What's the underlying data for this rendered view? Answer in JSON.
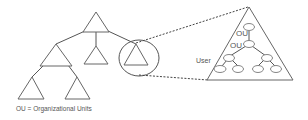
{
  "diagram": {
    "type": "hierarchy-tree",
    "legend": "OU = Organizational Units",
    "detail_labels": {
      "ou_upper": "OU",
      "ou_lower": "OU",
      "user": "User"
    },
    "colors": {
      "line": "#555555",
      "text": "#555555",
      "background": "#ffffff"
    }
  }
}
